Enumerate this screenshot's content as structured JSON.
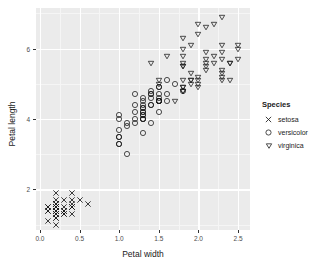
{
  "chart_data": {
    "type": "scatter",
    "title": "",
    "xlabel": "Petal width",
    "ylabel": "Petal length",
    "xlim": [
      -0.05,
      2.65
    ],
    "ylim": [
      0.85,
      7.15
    ],
    "grid": true,
    "legend_position": "right",
    "legend_title": "Species",
    "xticks": [
      "0.0",
      "0.5",
      "1.0",
      "1.5",
      "2.0",
      "2.5"
    ],
    "xtick_values": [
      0.0,
      0.5,
      1.0,
      1.5,
      2.0,
      2.5
    ],
    "yticks": [
      "2",
      "4",
      "6"
    ],
    "ytick_values": [
      2,
      4,
      6
    ],
    "xminor_values": [
      0.25,
      0.75,
      1.25,
      1.75,
      2.25
    ],
    "yminor_values": [
      1,
      3,
      5,
      7
    ],
    "series": [
      {
        "name": "setosa",
        "marker": "cross",
        "marker_glyph": "×",
        "color": "#1a1a1a",
        "points": [
          [
            0.2,
            1.4
          ],
          [
            0.2,
            1.4
          ],
          [
            0.2,
            1.3
          ],
          [
            0.2,
            1.5
          ],
          [
            0.2,
            1.4
          ],
          [
            0.4,
            1.7
          ],
          [
            0.3,
            1.4
          ],
          [
            0.2,
            1.5
          ],
          [
            0.2,
            1.4
          ],
          [
            0.1,
            1.5
          ],
          [
            0.2,
            1.5
          ],
          [
            0.2,
            1.6
          ],
          [
            0.1,
            1.4
          ],
          [
            0.1,
            1.1
          ],
          [
            0.2,
            1.2
          ],
          [
            0.4,
            1.5
          ],
          [
            0.4,
            1.3
          ],
          [
            0.3,
            1.4
          ],
          [
            0.3,
            1.7
          ],
          [
            0.3,
            1.5
          ],
          [
            0.2,
            1.7
          ],
          [
            0.4,
            1.5
          ],
          [
            0.2,
            1.0
          ],
          [
            0.5,
            1.7
          ],
          [
            0.2,
            1.9
          ],
          [
            0.2,
            1.6
          ],
          [
            0.4,
            1.6
          ],
          [
            0.2,
            1.5
          ],
          [
            0.2,
            1.4
          ],
          [
            0.2,
            1.6
          ],
          [
            0.2,
            1.6
          ],
          [
            0.4,
            1.5
          ],
          [
            0.1,
            1.5
          ],
          [
            0.2,
            1.4
          ],
          [
            0.2,
            1.5
          ],
          [
            0.2,
            1.2
          ],
          [
            0.2,
            1.3
          ],
          [
            0.1,
            1.4
          ],
          [
            0.2,
            1.3
          ],
          [
            0.2,
            1.5
          ],
          [
            0.3,
            1.3
          ],
          [
            0.3,
            1.3
          ],
          [
            0.2,
            1.3
          ],
          [
            0.6,
            1.6
          ],
          [
            0.4,
            1.9
          ],
          [
            0.3,
            1.4
          ],
          [
            0.2,
            1.6
          ],
          [
            0.2,
            1.4
          ],
          [
            0.2,
            1.5
          ],
          [
            0.2,
            1.4
          ]
        ]
      },
      {
        "name": "versicolor",
        "marker": "circle",
        "marker_glyph": "○",
        "color": "#1a1a1a",
        "points": [
          [
            1.4,
            4.7
          ],
          [
            1.5,
            4.5
          ],
          [
            1.5,
            4.9
          ],
          [
            1.3,
            4.0
          ],
          [
            1.5,
            4.6
          ],
          [
            1.3,
            4.5
          ],
          [
            1.6,
            4.7
          ],
          [
            1.0,
            3.3
          ],
          [
            1.3,
            4.6
          ],
          [
            1.4,
            3.9
          ],
          [
            1.0,
            3.5
          ],
          [
            1.5,
            4.2
          ],
          [
            1.0,
            4.0
          ],
          [
            1.4,
            4.7
          ],
          [
            1.3,
            3.6
          ],
          [
            1.4,
            4.4
          ],
          [
            1.5,
            4.5
          ],
          [
            1.0,
            4.1
          ],
          [
            1.5,
            4.5
          ],
          [
            1.1,
            3.9
          ],
          [
            1.8,
            4.8
          ],
          [
            1.3,
            4.0
          ],
          [
            1.5,
            4.9
          ],
          [
            1.2,
            4.7
          ],
          [
            1.3,
            4.3
          ],
          [
            1.4,
            4.4
          ],
          [
            1.4,
            4.8
          ],
          [
            1.7,
            5.0
          ],
          [
            1.5,
            4.5
          ],
          [
            1.0,
            3.5
          ],
          [
            1.1,
            3.8
          ],
          [
            1.0,
            3.7
          ],
          [
            1.2,
            3.9
          ],
          [
            1.6,
            5.1
          ],
          [
            1.5,
            4.5
          ],
          [
            1.6,
            4.5
          ],
          [
            1.5,
            4.7
          ],
          [
            1.3,
            4.4
          ],
          [
            1.3,
            4.1
          ],
          [
            1.3,
            4.0
          ],
          [
            1.2,
            4.4
          ],
          [
            1.4,
            4.6
          ],
          [
            1.2,
            4.0
          ],
          [
            1.0,
            3.3
          ],
          [
            1.3,
            4.2
          ],
          [
            1.2,
            4.2
          ],
          [
            1.3,
            4.2
          ],
          [
            1.3,
            4.3
          ],
          [
            1.1,
            3.0
          ],
          [
            1.3,
            4.1
          ]
        ]
      },
      {
        "name": "virginica",
        "marker": "triangle-down",
        "marker_glyph": "▽",
        "color": "#1a1a1a",
        "points": [
          [
            2.5,
            6.0
          ],
          [
            1.9,
            5.1
          ],
          [
            2.1,
            5.9
          ],
          [
            1.8,
            5.6
          ],
          [
            2.2,
            5.8
          ],
          [
            2.1,
            6.6
          ],
          [
            1.7,
            4.5
          ],
          [
            1.8,
            6.3
          ],
          [
            1.8,
            5.8
          ],
          [
            2.5,
            6.1
          ],
          [
            2.0,
            5.1
          ],
          [
            1.9,
            5.3
          ],
          [
            2.1,
            5.5
          ],
          [
            2.0,
            5.0
          ],
          [
            2.4,
            5.1
          ],
          [
            2.3,
            5.3
          ],
          [
            1.8,
            5.5
          ],
          [
            2.2,
            6.7
          ],
          [
            2.3,
            6.9
          ],
          [
            1.5,
            5.0
          ],
          [
            2.3,
            5.7
          ],
          [
            2.0,
            4.9
          ],
          [
            2.0,
            6.7
          ],
          [
            1.8,
            4.9
          ],
          [
            2.1,
            5.7
          ],
          [
            1.8,
            6.0
          ],
          [
            1.8,
            4.8
          ],
          [
            1.8,
            4.9
          ],
          [
            2.1,
            5.6
          ],
          [
            1.6,
            5.8
          ],
          [
            1.9,
            6.1
          ],
          [
            2.0,
            6.4
          ],
          [
            2.2,
            5.6
          ],
          [
            1.5,
            5.1
          ],
          [
            1.4,
            5.6
          ],
          [
            2.3,
            6.1
          ],
          [
            2.4,
            5.6
          ],
          [
            1.8,
            5.5
          ],
          [
            1.8,
            4.8
          ],
          [
            2.1,
            5.4
          ],
          [
            2.4,
            5.6
          ],
          [
            2.3,
            5.1
          ],
          [
            1.9,
            5.1
          ],
          [
            2.3,
            5.9
          ],
          [
            2.5,
            5.7
          ],
          [
            2.3,
            5.2
          ],
          [
            1.9,
            5.0
          ],
          [
            2.0,
            5.2
          ],
          [
            2.3,
            5.4
          ],
          [
            1.8,
            5.1
          ]
        ]
      }
    ]
  },
  "legend": {
    "title": "Species",
    "items": [
      {
        "label": "setosa",
        "marker": "cross"
      },
      {
        "label": "versicolor",
        "marker": "circle"
      },
      {
        "label": "virginica",
        "marker": "triangle-down"
      }
    ]
  },
  "axes": {
    "x_title": "Petal width",
    "y_title": "Petal length"
  },
  "colors": {
    "panel_background": "#ebebeb",
    "gridline_major": "#ffffff",
    "gridline_minor": "#f5f5f5",
    "point": "#1a1a1a",
    "text": "#1a1a1a",
    "tick_text": "#4d4d4d",
    "page_background": "#ffffff"
  }
}
